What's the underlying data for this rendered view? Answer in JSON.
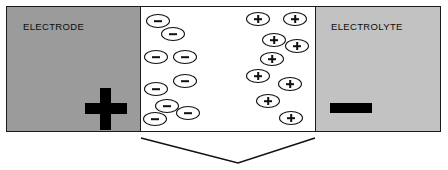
{
  "figure": {
    "width": 448,
    "height": 170,
    "background": "#ffffff"
  },
  "colors": {
    "electrode_fill": "#9b9b9b",
    "electrolyte_fill": "#c2c2c2",
    "double_layer_fill": "#ffffff",
    "outline": "#1a1a1a",
    "sign_color": "#000000",
    "ion_outline": "#101010"
  },
  "panels": {
    "electrode": {
      "label": "ELECTRODE",
      "polarity_sign": "+",
      "polarity_name": "plus-sign",
      "fill": "#9b9b9b"
    },
    "double_layer": {
      "label": "",
      "fill": "#ffffff"
    },
    "electrolyte": {
      "label": "ELECTROLYTE",
      "polarity_sign": "−",
      "polarity_name": "minus-sign",
      "fill": "#c2c2c2"
    }
  },
  "chart_data": {
    "type": "scatter",
    "xlabel": "",
    "ylabel": "",
    "xlim": [
      140,
      316
    ],
    "ylim": [
      6,
      132
    ],
    "grid": false,
    "legend": "none",
    "series": [
      {
        "name": "negative ions",
        "symbol": "−",
        "marker": "ellipse",
        "count": 10,
        "points": [
          {
            "x": 152,
            "y": 18
          },
          {
            "x": 167,
            "y": 30
          },
          {
            "x": 150,
            "y": 51
          },
          {
            "x": 178,
            "y": 51
          },
          {
            "x": 150,
            "y": 80
          },
          {
            "x": 179,
            "y": 71
          },
          {
            "x": 161,
            "y": 101
          },
          {
            "x": 145,
            "y": 113
          },
          {
            "x": 180,
            "y": 110
          },
          {
            "x": 152,
            "y": 18
          }
        ]
      },
      {
        "name": "positive ions",
        "symbol": "+",
        "marker": "ellipse",
        "count": 11,
        "points": [
          {
            "x": 249,
            "y": 14
          },
          {
            "x": 285,
            "y": 14
          },
          {
            "x": 264,
            "y": 35
          },
          {
            "x": 288,
            "y": 41
          },
          {
            "x": 262,
            "y": 54
          },
          {
            "x": 249,
            "y": 70
          },
          {
            "x": 281,
            "y": 78
          },
          {
            "x": 258,
            "y": 95
          },
          {
            "x": 280,
            "y": 113
          },
          {
            "x": 249,
            "y": 14
          },
          {
            "x": 285,
            "y": 14
          }
        ]
      }
    ]
  },
  "ions": {
    "negative": [
      {
        "name": "negative-ion-1",
        "x": 146,
        "y": 14,
        "sign": "minus"
      },
      {
        "name": "negative-ion-2",
        "x": 161,
        "y": 27,
        "sign": "minus"
      },
      {
        "name": "negative-ion-3",
        "x": 144,
        "y": 50,
        "sign": "minus"
      },
      {
        "name": "negative-ion-4",
        "x": 173,
        "y": 50,
        "sign": "minus"
      },
      {
        "name": "negative-ion-5",
        "x": 173,
        "y": 74,
        "sign": "minus"
      },
      {
        "name": "negative-ion-6",
        "x": 144,
        "y": 82,
        "sign": "minus"
      },
      {
        "name": "negative-ion-7",
        "x": 155,
        "y": 99,
        "sign": "minus"
      },
      {
        "name": "negative-ion-8",
        "x": 176,
        "y": 106,
        "sign": "minus"
      },
      {
        "name": "negative-ion-9",
        "x": 143,
        "y": 112,
        "sign": "minus"
      }
    ],
    "positive": [
      {
        "name": "positive-ion-1",
        "x": 246,
        "y": 12,
        "sign": "plus"
      },
      {
        "name": "positive-ion-2",
        "x": 283,
        "y": 12,
        "sign": "plus"
      },
      {
        "name": "positive-ion-3",
        "x": 262,
        "y": 33,
        "sign": "plus"
      },
      {
        "name": "positive-ion-4",
        "x": 285,
        "y": 39,
        "sign": "plus"
      },
      {
        "name": "positive-ion-5",
        "x": 260,
        "y": 52,
        "sign": "plus"
      },
      {
        "name": "positive-ion-6",
        "x": 246,
        "y": 69,
        "sign": "plus"
      },
      {
        "name": "positive-ion-7",
        "x": 278,
        "y": 77,
        "sign": "plus"
      },
      {
        "name": "positive-ion-8",
        "x": 256,
        "y": 94,
        "sign": "plus"
      },
      {
        "name": "positive-ion-9",
        "x": 279,
        "y": 111,
        "sign": "plus"
      }
    ]
  },
  "brace": {
    "name": "interphase-brace",
    "points": "141,138 238,163 315,138",
    "stroke": "#111111",
    "stroke_width": 1.6,
    "label": ""
  }
}
